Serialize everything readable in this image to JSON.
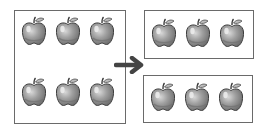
{
  "diagram": {
    "source_group": {
      "apple_count": 6,
      "rows": 2,
      "per_row": 3
    },
    "arrow": {
      "icon": "right-arrow-icon",
      "color": "#4a4a4a"
    },
    "target_groups": [
      {
        "apple_count": 3
      },
      {
        "apple_count": 3
      }
    ],
    "colors": {
      "apple_fill": "#9a9a9a",
      "apple_dark": "#6e6e6e",
      "apple_highlight": "#e6e6e6",
      "outline": "#4a4a4a",
      "box_border": "#6a6a6a"
    }
  }
}
